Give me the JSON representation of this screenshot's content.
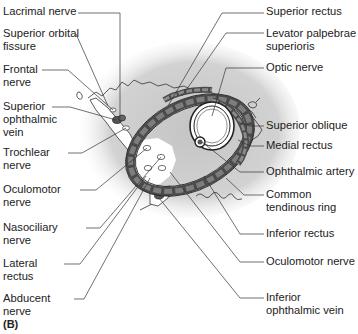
{
  "figure": {
    "panel_label": "(B)",
    "colors": {
      "background": "#ffffff",
      "shade": "#c8c8c8",
      "ring": "#5a5a5a",
      "muscle": "#9a9a9a",
      "line": "#333333",
      "text": "#222222"
    }
  },
  "labels_left": [
    {
      "line1": "Lacrimal nerve",
      "line2": ""
    },
    {
      "line1": "Superior orbital",
      "line2": "fissure"
    },
    {
      "line1": "Frontal",
      "line2": "nerve"
    },
    {
      "line1": "Superior",
      "line2": "ophthalmic",
      "line3": "vein"
    },
    {
      "line1": "Trochlear",
      "line2": "nerve"
    },
    {
      "line1": "Oculomotor",
      "line2": "nerve"
    },
    {
      "line1": "Nasociliary",
      "line2": "nerve"
    },
    {
      "line1": "Lateral",
      "line2": "rectus"
    },
    {
      "line1": "Abducent",
      "line2": "nerve"
    }
  ],
  "labels_right": [
    {
      "line1": "Superior rectus",
      "line2": ""
    },
    {
      "line1": "Levator palpebrae",
      "line2": "superioris"
    },
    {
      "line1": "Optic nerve",
      "line2": ""
    },
    {
      "line1": "Superior oblique",
      "line2": ""
    },
    {
      "line1": "Medial rectus",
      "line2": ""
    },
    {
      "line1": "Ophthalmic artery",
      "line2": ""
    },
    {
      "line1": "Common",
      "line2": "tendinous ring"
    },
    {
      "line1": "Inferior rectus",
      "line2": ""
    },
    {
      "line1": "Oculomotor nerve",
      "line2": ""
    },
    {
      "line1": "Inferior",
      "line2": "ophthalmic vein"
    }
  ]
}
